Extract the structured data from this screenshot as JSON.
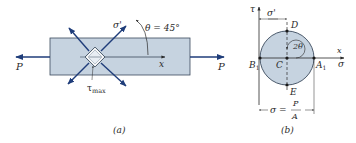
{
  "colors": {
    "bar_fill": "#c6d3e0",
    "bar_stroke": "#3a4a5c",
    "arrow": "#1f3d7a",
    "circle_fill": "#c6d3e0",
    "ink": "#2a2a2a"
  },
  "figure_a": {
    "caption": "(a)",
    "load_left": "P",
    "load_right": "P",
    "axis_x": "x",
    "angle_label": "θ = 45°",
    "normal_stress_label": "σ'",
    "shear_stress_label": "τ",
    "shear_stress_sub": "max"
  },
  "figure_b": {
    "caption": "(b)",
    "axis_tau": "τ",
    "axis_sigma": "σ",
    "axis_x": "x",
    "dim_top": "σ'",
    "point_D": "D",
    "point_E": "E",
    "point_C": "C",
    "point_B": "B",
    "point_B_sub": "1",
    "point_A": "A",
    "point_A_sub": "1",
    "angle_label": "2θ",
    "dim_bottom_lhs": "σ =",
    "dim_bottom_num": "P",
    "dim_bottom_den": "A"
  }
}
